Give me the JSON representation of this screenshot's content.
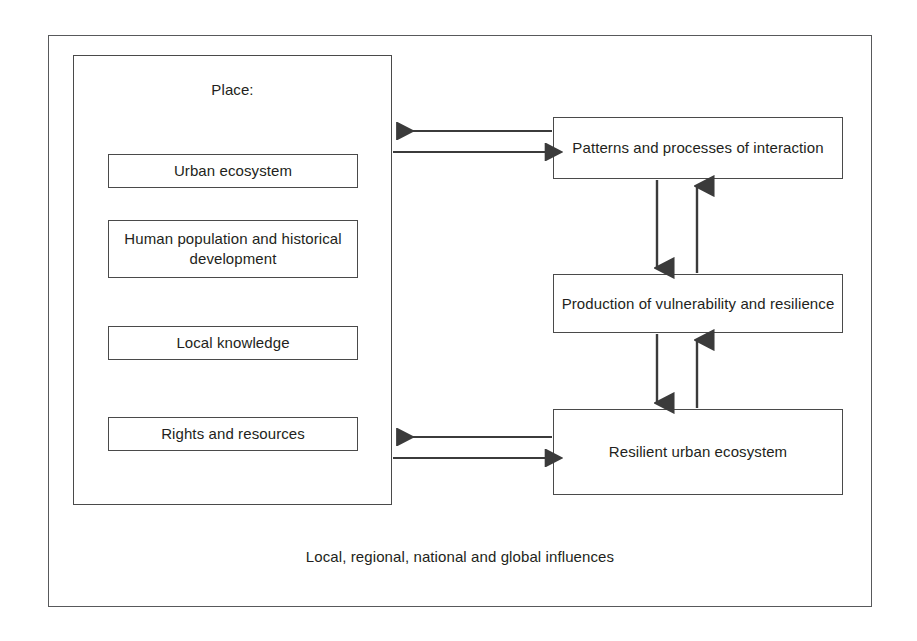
{
  "diagram": {
    "title_caption": "Local, regional, national and global influences",
    "place_panel": {
      "label": "Place:",
      "items": [
        {
          "label": "Urban ecosystem"
        },
        {
          "label": "Human population and historical development"
        },
        {
          "label": "Local knowledge"
        },
        {
          "label": "Rights and resources"
        }
      ]
    },
    "process_boxes": [
      {
        "label": "Patterns and processes of interaction"
      },
      {
        "label": "Production of vulnerability and resilience"
      },
      {
        "label": "Resilient urban ecosystem"
      }
    ],
    "connectors": [
      {
        "name": "place-to-patterns",
        "direction": "bidirectional",
        "orientation": "horizontal"
      },
      {
        "name": "patterns-to-production",
        "direction": "bidirectional",
        "orientation": "vertical"
      },
      {
        "name": "production-to-resilient",
        "direction": "bidirectional",
        "orientation": "vertical"
      },
      {
        "name": "place-to-resilient",
        "direction": "bidirectional",
        "orientation": "horizontal"
      }
    ],
    "colors": {
      "stroke": "#3b3b3b",
      "box_border": "#4a4a4a",
      "frame_border": "#58595b",
      "text": "#231f20",
      "background": "#ffffff"
    }
  }
}
